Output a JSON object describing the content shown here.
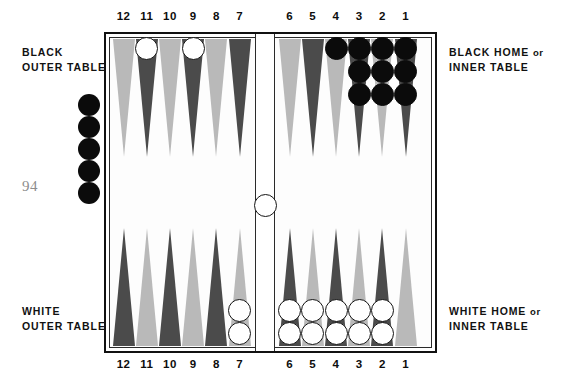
{
  "page": {
    "folio": "94"
  },
  "labels": {
    "black_outer": {
      "line1": "BLACK",
      "line2": "OUTER TABLE"
    },
    "white_outer": {
      "line1": "WHITE",
      "line2": "OUTER TABLE"
    },
    "black_home": {
      "line1a": "BLACK HOME",
      "line1b": "or",
      "line2": "INNER TABLE"
    },
    "white_home": {
      "line1a": "WHITE HOME",
      "line1b": "or",
      "line2": "INNER TABLE"
    }
  },
  "point_numbers": {
    "top": [
      "12",
      "11",
      "10",
      "9",
      "8",
      "7",
      "6",
      "5",
      "4",
      "3",
      "2",
      "1"
    ],
    "bottom": [
      "12",
      "11",
      "10",
      "9",
      "8",
      "7",
      "6",
      "5",
      "4",
      "3",
      "2",
      "1"
    ]
  },
  "colors": {
    "point_light": "#b9b9b9",
    "point_dark": "#4b4b4b",
    "checker_black": "#0b0b0b",
    "checker_white": "#ffffff",
    "frame": "#111111",
    "folio": "#8d8d8d"
  },
  "board": {
    "top_points": [
      {
        "number": "12",
        "shade": "light",
        "checkers": 0,
        "color": null
      },
      {
        "number": "11",
        "shade": "dark",
        "checkers": 1,
        "color": "white"
      },
      {
        "number": "10",
        "shade": "light",
        "checkers": 0,
        "color": null
      },
      {
        "number": "9",
        "shade": "dark",
        "checkers": 1,
        "color": "white"
      },
      {
        "number": "8",
        "shade": "light",
        "checkers": 0,
        "color": null
      },
      {
        "number": "7",
        "shade": "dark",
        "checkers": 0,
        "color": null
      },
      {
        "number": "6",
        "shade": "light",
        "checkers": 0,
        "color": null
      },
      {
        "number": "5",
        "shade": "dark",
        "checkers": 0,
        "color": null
      },
      {
        "number": "4",
        "shade": "light",
        "checkers": 1,
        "color": "black"
      },
      {
        "number": "3",
        "shade": "dark",
        "checkers": 3,
        "color": "black"
      },
      {
        "number": "2",
        "shade": "light",
        "checkers": 3,
        "color": "black"
      },
      {
        "number": "1",
        "shade": "dark",
        "checkers": 3,
        "color": "black"
      }
    ],
    "bottom_points": [
      {
        "number": "12",
        "shade": "dark",
        "checkers": 0,
        "color": null
      },
      {
        "number": "11",
        "shade": "light",
        "checkers": 0,
        "color": null
      },
      {
        "number": "10",
        "shade": "dark",
        "checkers": 0,
        "color": null
      },
      {
        "number": "9",
        "shade": "light",
        "checkers": 0,
        "color": null
      },
      {
        "number": "8",
        "shade": "dark",
        "checkers": 0,
        "color": null
      },
      {
        "number": "7",
        "shade": "light",
        "checkers": 2,
        "color": "white"
      },
      {
        "number": "6",
        "shade": "dark",
        "checkers": 2,
        "color": "white"
      },
      {
        "number": "5",
        "shade": "light",
        "checkers": 2,
        "color": "white"
      },
      {
        "number": "4",
        "shade": "dark",
        "checkers": 2,
        "color": "white"
      },
      {
        "number": "3",
        "shade": "light",
        "checkers": 2,
        "color": "white"
      },
      {
        "number": "2",
        "shade": "dark",
        "checkers": 2,
        "color": "white"
      },
      {
        "number": "1",
        "shade": "light",
        "checkers": 0,
        "color": null
      }
    ],
    "bar": {
      "checkers": 1,
      "color": "white"
    },
    "off_tray_left": {
      "checkers": 5,
      "color": "black"
    }
  }
}
